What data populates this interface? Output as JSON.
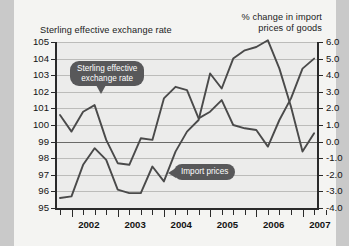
{
  "header": {
    "left_axis_title": "Sterling effective exchange rate",
    "right_axis_title_line1": "% change in import",
    "right_axis_title_line2": "prices of goods"
  },
  "callouts": {
    "sterling_line1": "Sterling effective",
    "sterling_line2": "exchange rate",
    "import": "Import prices"
  },
  "colors": {
    "line": "#4a4a4a",
    "callout_bg": "#58585a",
    "plot_bg": "#ececeb",
    "page_bg": "#f4f4f2",
    "frame": "#c9c9c9"
  },
  "chart_data": {
    "type": "line",
    "title": "",
    "xlabel": "",
    "grid": true,
    "legend": "inline-callouts",
    "x_tick_labels": [
      "2002",
      "2003",
      "2004",
      "2005",
      "2006",
      "2007"
    ],
    "x_minor_ticks_per_year": 4,
    "axes": {
      "left": {
        "label": "Sterling effective exchange rate",
        "ylim": [
          95,
          105
        ],
        "ticks": [
          95,
          96,
          97,
          98,
          99,
          100,
          101,
          102,
          103,
          104,
          105
        ],
        "tick_labels": [
          "95",
          "96",
          "97",
          "98",
          "99",
          "100",
          "101",
          "102",
          "103",
          "104",
          "105"
        ]
      },
      "right": {
        "label": "% change in import prices of goods",
        "ylim": [
          -4.0,
          6.0
        ],
        "ticks": [
          -4.0,
          -3.0,
          -2.0,
          -1.0,
          0.0,
          1.0,
          2.0,
          3.0,
          4.0,
          5.0,
          6.0
        ],
        "tick_labels": [
          "-4.0",
          "-3.0",
          "-2.0",
          "-1.0",
          "0.0",
          "1.0",
          "2.0",
          "3.0",
          "4.0",
          "5.0",
          "6.0"
        ]
      }
    },
    "series": [
      {
        "name": "Sterling effective exchange rate",
        "axis": "left",
        "x": [
          "2001Q4",
          "2002Q1",
          "2002Q2",
          "2002Q3",
          "2002Q4",
          "2003Q1",
          "2003Q2",
          "2003Q3",
          "2003Q4",
          "2004Q1",
          "2004Q2",
          "2004Q3",
          "2004Q4",
          "2005Q1",
          "2005Q2",
          "2005Q3",
          "2005Q4",
          "2006Q1",
          "2006Q2",
          "2006Q3",
          "2006Q4",
          "2007Q1",
          "2007Q2"
        ],
        "values": [
          100.6,
          99.6,
          100.8,
          101.2,
          99.1,
          97.7,
          97.6,
          99.2,
          99.1,
          101.6,
          102.3,
          102.1,
          100.4,
          100.8,
          101.5,
          100.0,
          99.8,
          99.7,
          98.7,
          100.3,
          101.6,
          103.4,
          104.0
        ]
      },
      {
        "name": "Import prices",
        "axis": "right",
        "x": [
          "2001Q4",
          "2002Q1",
          "2002Q2",
          "2002Q3",
          "2002Q4",
          "2003Q1",
          "2003Q2",
          "2003Q3",
          "2003Q4",
          "2004Q1",
          "2004Q2",
          "2004Q3",
          "2004Q4",
          "2005Q1",
          "2005Q2",
          "2005Q3",
          "2005Q4",
          "2006Q1",
          "2006Q2",
          "2006Q3",
          "2006Q4",
          "2007Q1",
          "2007Q2"
        ],
        "values": [
          -3.4,
          -3.3,
          -1.4,
          -0.4,
          -1.1,
          -2.9,
          -3.1,
          -3.1,
          -1.5,
          -2.4,
          -0.6,
          0.6,
          1.3,
          4.1,
          3.2,
          5.0,
          5.5,
          5.7,
          6.1,
          4.4,
          2.1,
          -0.6,
          0.5
        ]
      }
    ]
  }
}
